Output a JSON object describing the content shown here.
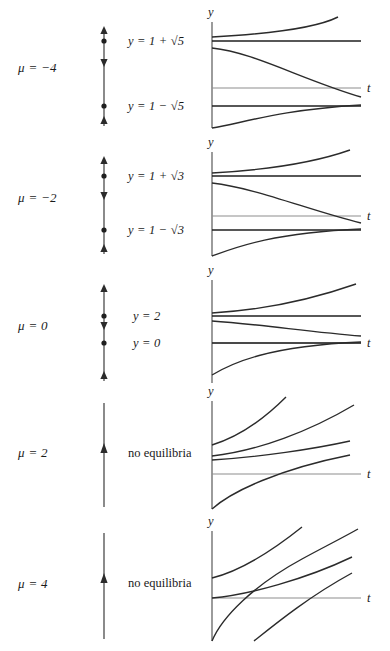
{
  "figure": {
    "type": "bifurcation-phase-portrait",
    "axis_labels": {
      "vertical": "y",
      "horizontal": "t"
    },
    "rows": [
      {
        "id": "mu-neg-4",
        "mu_label": "μ = −4",
        "mu_value": -4,
        "equilibria_text": [
          "y = 1 + √5",
          "y = 1 − √5"
        ],
        "equilibria_values": [
          3.236,
          -1.236
        ],
        "has_equilibria": true,
        "phase_arrows": [
          "up",
          "down",
          "up"
        ],
        "stability": [
          "unstable",
          "stable"
        ],
        "note": ""
      },
      {
        "id": "mu-neg-2",
        "mu_label": "μ = −2",
        "mu_value": -2,
        "equilibria_text": [
          "y = 1 + √3",
          "y = 1 − √3"
        ],
        "equilibria_values": [
          2.732,
          -0.732
        ],
        "has_equilibria": true,
        "phase_arrows": [
          "up",
          "down",
          "up"
        ],
        "stability": [
          "unstable",
          "stable"
        ],
        "note": ""
      },
      {
        "id": "mu-0",
        "mu_label": "μ = 0",
        "mu_value": 0,
        "equilibria_text": [
          "y = 2",
          "y = 0"
        ],
        "equilibria_values": [
          2,
          0
        ],
        "has_equilibria": true,
        "phase_arrows": [
          "up",
          "down",
          "up"
        ],
        "stability": [
          "unstable",
          "stable"
        ],
        "note": ""
      },
      {
        "id": "mu-2",
        "mu_label": "μ = 2",
        "mu_value": 2,
        "equilibria_text": [],
        "equilibria_values": [],
        "has_equilibria": false,
        "phase_arrows": [
          "up"
        ],
        "stability": [],
        "note": "no equilibria"
      },
      {
        "id": "mu-4",
        "mu_label": "μ = 4",
        "mu_value": 4,
        "equilibria_text": [],
        "equilibria_values": [],
        "has_equilibria": false,
        "phase_arrows": [
          "up"
        ],
        "stability": [],
        "note": "no equilibria"
      }
    ],
    "colors": {
      "ink": "#1a1a1a",
      "curve": "#2b2b2b",
      "equilibrium_line": "#1f1f1f",
      "t_axis": "#8d8d8d",
      "background": "#ffffff"
    }
  }
}
